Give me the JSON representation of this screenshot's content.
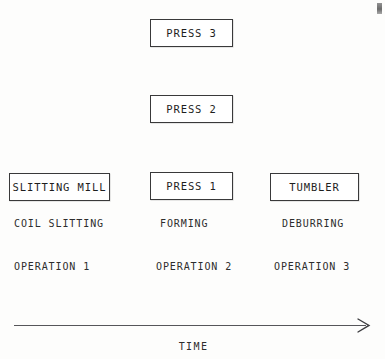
{
  "diagram": {
    "type": "process-flow-timeline",
    "line_color": "#56565a",
    "box_border_color": "#39393a",
    "text_color": "#2d2d2d",
    "background_color": "#fdfdfc"
  },
  "boxes": [
    {
      "id": "press3",
      "label": "PRESS 3",
      "column": 2,
      "level": 3
    },
    {
      "id": "press2",
      "label": "PRESS 2",
      "column": 2,
      "level": 2
    },
    {
      "id": "slitting",
      "label": "SLITTING MILL",
      "column": 1,
      "level": 1
    },
    {
      "id": "press1",
      "label": "PRESS 1",
      "column": 2,
      "level": 1
    },
    {
      "id": "tumbler",
      "label": "TUMBLER",
      "column": 3,
      "level": 1
    }
  ],
  "columns": [
    {
      "operation_label": "OPERATION 1",
      "process_label": "COIL SLITTING",
      "machine_labels": [
        "SLITTING MILL"
      ]
    },
    {
      "operation_label": "OPERATION 2",
      "process_label": "FORMING",
      "machine_labels": [
        "PRESS 1",
        "PRESS 2",
        "PRESS 3"
      ]
    },
    {
      "operation_label": "OPERATION 3",
      "process_label": "DEBURRING",
      "machine_labels": [
        "TUMBLER"
      ]
    }
  ],
  "axis": {
    "label": "TIME",
    "direction": "left-to-right",
    "arrowhead": "open-chevron-right"
  }
}
